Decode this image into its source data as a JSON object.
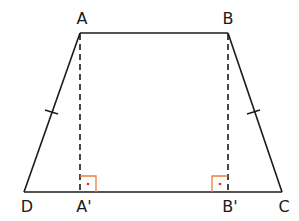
{
  "figure": {
    "type": "isosceles-trapezoid",
    "colors": {
      "stroke": "#1a1a1a",
      "right_angle_marker": "#e8803a",
      "right_angle_dot": "#d9302a",
      "background": "#ffffff"
    },
    "vertices": {
      "A": {
        "label": "A",
        "x": 80,
        "y": 33,
        "label_x": 82,
        "label_y": 11
      },
      "B": {
        "label": "B",
        "x": 228,
        "y": 33,
        "label_x": 228,
        "label_y": 11
      },
      "C": {
        "label": "C",
        "x": 282,
        "y": 192,
        "label_x": 284,
        "label_y": 199
      },
      "D": {
        "label": "D",
        "x": 24,
        "y": 192,
        "label_x": 27,
        "label_y": 199
      }
    },
    "feet": {
      "A_prime": {
        "label": "A'",
        "x": 80,
        "y": 192,
        "label_x": 83,
        "label_y": 199
      },
      "B_prime": {
        "label": "B'",
        "x": 228,
        "y": 192,
        "label_x": 229,
        "label_y": 199
      }
    },
    "segments": [
      {
        "name": "AB",
        "style": "solid"
      },
      {
        "name": "BC",
        "style": "solid"
      },
      {
        "name": "CD",
        "style": "solid"
      },
      {
        "name": "DA",
        "style": "solid"
      },
      {
        "name": "AA'",
        "style": "dashed"
      },
      {
        "name": "BB'",
        "style": "dashed"
      }
    ],
    "equal_marks": [
      {
        "segment": "AD",
        "ticks": 1
      },
      {
        "segment": "BC",
        "ticks": 1
      }
    ],
    "right_angles": [
      {
        "at": "A'"
      },
      {
        "at": "B'"
      }
    ]
  }
}
